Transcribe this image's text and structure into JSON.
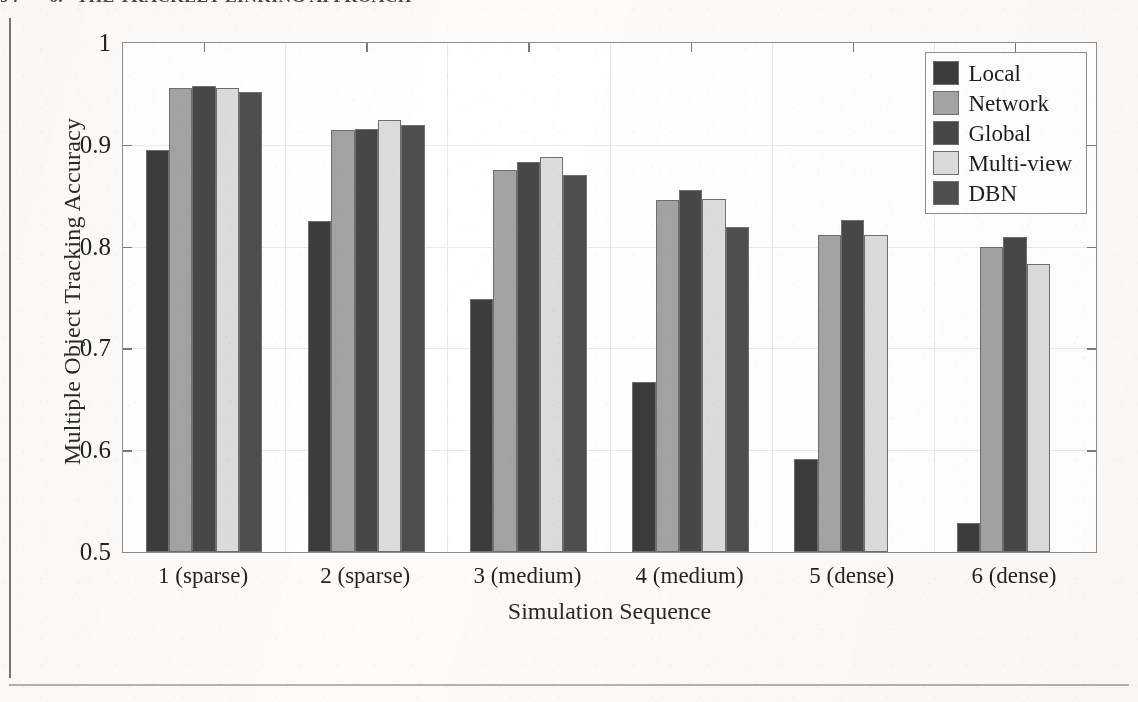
{
  "page": {
    "running_header_page": "94",
    "running_header_chapter": "6.",
    "running_header_title": "THE TRACKLET LINKING APPROACH"
  },
  "chart_data": {
    "type": "bar",
    "title": "",
    "xlabel": "Simulation Sequence",
    "ylabel": "Multiple Object Tracking Accuracy",
    "categories": [
      "1 (sparse)",
      "2 (sparse)",
      "3 (medium)",
      "4 (medium)",
      "5 (dense)",
      "6 (dense)"
    ],
    "ylim": [
      0.5,
      1
    ],
    "ytick_labels": [
      "0.5",
      "0.6",
      "0.7",
      "0.8",
      "0.9",
      "1"
    ],
    "ytick_values": [
      0.5,
      0.6,
      0.7,
      0.8,
      0.9,
      1
    ],
    "grid": true,
    "legend_position": "top-right",
    "series": [
      {
        "name": "Local",
        "color": "#3c3c3c",
        "values": [
          0.895,
          0.825,
          0.749,
          0.667,
          0.591,
          0.528
        ]
      },
      {
        "name": "Network",
        "color": "#a3a3a3",
        "values": [
          0.956,
          0.915,
          0.875,
          0.846,
          0.811,
          0.8
        ]
      },
      {
        "name": "Global",
        "color": "#474747",
        "values": [
          0.958,
          0.916,
          0.883,
          0.856,
          0.826,
          0.809
        ]
      },
      {
        "name": "Multi-view",
        "color": "#dcdcdc",
        "values": [
          0.956,
          0.924,
          0.888,
          0.847,
          0.811,
          0.783
        ]
      },
      {
        "name": "DBN",
        "color": "#4e4e4e",
        "values": [
          0.952,
          0.919,
          0.87,
          0.819,
          null,
          null
        ]
      }
    ]
  }
}
